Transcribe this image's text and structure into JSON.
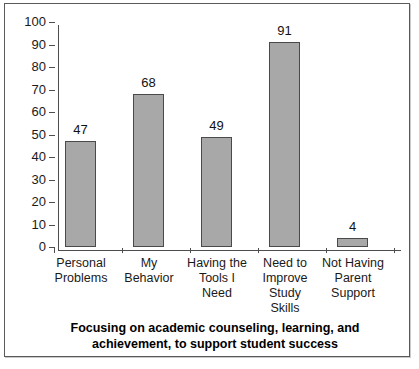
{
  "chart_data": {
    "type": "bar",
    "title": "",
    "caption": "Focusing on academic counseling, learning, and achievement, to support student success",
    "categories": [
      "Personal Problems",
      "My Behavior",
      "Having the Tools I Need",
      "Need to Improve Study Skills",
      "Not Having Parent Support"
    ],
    "category_lines": [
      [
        "Personal",
        "Problems"
      ],
      [
        "My",
        "Behavior"
      ],
      [
        "Having the",
        "Tools I",
        "Need"
      ],
      [
        "Need to",
        "Improve",
        "Study",
        "Skills"
      ],
      [
        "Not Having",
        "Parent",
        "Support"
      ]
    ],
    "values": [
      47,
      68,
      49,
      91,
      4
    ],
    "value_labels": [
      "47",
      "68",
      "49",
      "91",
      "4"
    ],
    "xlabel": "",
    "ylabel": "",
    "ylim": [
      0,
      100
    ],
    "ytick_step": 10,
    "ytick_labels": [
      "100",
      "90",
      "80",
      "70",
      "60",
      "50",
      "40",
      "30",
      "20",
      "10",
      "0"
    ],
    "grid": false,
    "legend": false,
    "legend_position": "none",
    "series": [
      {
        "name": "Responses",
        "values": [
          47,
          68,
          49,
          91,
          4
        ]
      }
    ],
    "colors": {
      "bar_fill": "#a8a8a8",
      "bar_outline": "#4a4a4a",
      "axis": "#4d4d4d",
      "text": "#1a1a1a",
      "frame": "#5a5a5a",
      "background": "#ffffff"
    }
  }
}
